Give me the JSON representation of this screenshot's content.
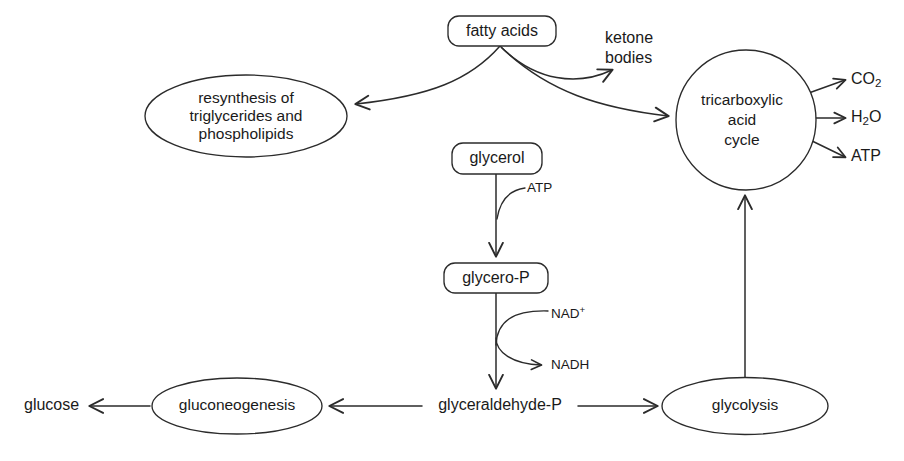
{
  "diagram": {
    "stroke_color": "#2b2b2b",
    "background_color": "#ffffff",
    "text_color": "#1a1a1a"
  },
  "nodes": {
    "fatty_acids": {
      "label": "fatty acids",
      "shape": "rounded-box"
    },
    "resynthesis": {
      "shape": "ellipse",
      "line1": "resynthesis of",
      "line2": "triglycerides and",
      "line3": "phospholipids"
    },
    "ketone_bodies": {
      "shape": "plain-text",
      "line1": "ketone",
      "line2": "bodies"
    },
    "tca_cycle": {
      "shape": "circle",
      "line1": "tricarboxylic",
      "line2": "acid",
      "line3": "cycle"
    },
    "glycerol": {
      "label": "glycerol",
      "shape": "rounded-box"
    },
    "glycero_p": {
      "label": "glycero-P",
      "shape": "rounded-box"
    },
    "glyceraldehyde_p": {
      "label": "glyceraldehyde-P",
      "shape": "plain-text"
    },
    "gluconeogenesis": {
      "label": "gluconeogenesis",
      "shape": "ellipse"
    },
    "glycolysis": {
      "label": "glycolysis",
      "shape": "ellipse"
    },
    "glucose": {
      "label": "glucose",
      "shape": "plain-text"
    }
  },
  "products": {
    "co2": {
      "formula": "CO",
      "subscript": "2"
    },
    "h2o": {
      "prefix": "H",
      "subscript": "2",
      "suffix": "O"
    },
    "atp": {
      "label": "ATP"
    }
  },
  "cofactors": {
    "atp_in": {
      "label": "ATP"
    },
    "nad_plus": {
      "base": "NAD",
      "superscript": "+"
    },
    "nadh": {
      "label": "NADH"
    }
  }
}
